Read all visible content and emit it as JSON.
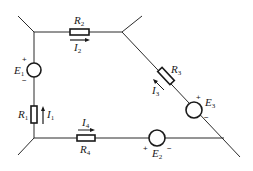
{
  "diagram": {
    "type": "circuit",
    "stroke_color": "#1a1a1a",
    "background": "#ffffff",
    "components": {
      "R1": {
        "symbol": "R",
        "sub": "1",
        "kind": "resistor",
        "branch": "left"
      },
      "R2": {
        "symbol": "R",
        "sub": "2",
        "kind": "resistor",
        "branch": "top"
      },
      "R3": {
        "symbol": "R",
        "sub": "3",
        "kind": "resistor",
        "branch": "diagonal"
      },
      "R4": {
        "symbol": "R",
        "sub": "4",
        "kind": "resistor",
        "branch": "bottom"
      },
      "E1": {
        "symbol": "E",
        "sub": "1",
        "kind": "voltage-source",
        "branch": "left",
        "plus": "+",
        "minus": "−"
      },
      "E2": {
        "symbol": "E",
        "sub": "2",
        "kind": "voltage-source",
        "branch": "bottom",
        "plus": "+",
        "minus": "−"
      },
      "E3": {
        "symbol": "E",
        "sub": "3",
        "kind": "voltage-source",
        "branch": "diagonal",
        "plus": "+",
        "minus": "−"
      }
    },
    "currents": {
      "I1": {
        "symbol": "I",
        "sub": "1",
        "direction": "up"
      },
      "I2": {
        "symbol": "I",
        "sub": "2",
        "direction": "right"
      },
      "I3": {
        "symbol": "I",
        "sub": "3",
        "direction": "up-left"
      },
      "I4": {
        "symbol": "I",
        "sub": "4",
        "direction": "right"
      }
    }
  }
}
